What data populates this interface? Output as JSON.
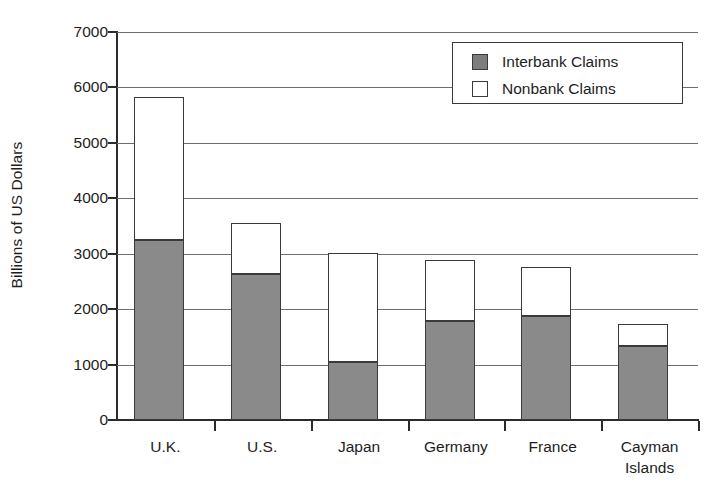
{
  "chart_data": {
    "type": "bar",
    "subtype": "stacked-vertical",
    "title": "",
    "xlabel": "",
    "ylabel": "Billions of US Dollars",
    "ylim": [
      0,
      7000
    ],
    "ytick_step": 1000,
    "ytick_labels": [
      "7000",
      "6000",
      "5000",
      "4000",
      "3000",
      "2000",
      "1000",
      "0"
    ],
    "ytick_values": [
      7000,
      6000,
      5000,
      4000,
      3000,
      2000,
      1000,
      0
    ],
    "grid": true,
    "grid_axis": "y",
    "legend_position": "top-right",
    "categories": [
      "U.K.",
      "U.S.",
      "Japan",
      "Germany",
      "France",
      "Cayman Islands"
    ],
    "category_labels": [
      {
        "line1": "U.K.",
        "line2": ""
      },
      {
        "line1": "U.S.",
        "line2": ""
      },
      {
        "line1": "Japan",
        "line2": ""
      },
      {
        "line1": "Germany",
        "line2": ""
      },
      {
        "line1": "France",
        "line2": ""
      },
      {
        "line1": "Cayman",
        "line2": "Islands"
      }
    ],
    "series": [
      {
        "name": "Interbank Claims",
        "color": "#8a8a8a",
        "values": [
          3250,
          2640,
          1040,
          1790,
          1880,
          1340
        ]
      },
      {
        "name": "Nonbank Claims",
        "color": "#ffffff",
        "values": [
          2570,
          920,
          1980,
          1100,
          890,
          400
        ]
      }
    ],
    "totals": [
      5820,
      3560,
      3020,
      2890,
      2770,
      1740
    ]
  },
  "legend": {
    "items": [
      {
        "label": "Interbank Claims",
        "swatch": "interbank"
      },
      {
        "label": "Nonbank Claims",
        "swatch": "nonbank"
      }
    ]
  },
  "colors": {
    "interbank_fill": "#8a8a8a",
    "nonbank_fill": "#ffffff",
    "outline": "#3a3a3a",
    "axis": "#2b2b2b",
    "gridline": "#6e6e6e",
    "text": "#1d1d1d",
    "background": "#ffffff"
  }
}
